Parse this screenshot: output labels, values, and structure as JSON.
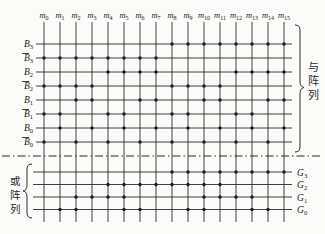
{
  "diagram": {
    "kind": "pla-binary-to-gray-converter",
    "background": "#fbfbf9",
    "line_color": "#2b2b2b",
    "dot_color": "#1a1a1a",
    "minterms": {
      "base": "m",
      "subscripts": [
        "0",
        "1",
        "2",
        "3",
        "4",
        "5",
        "6",
        "7",
        "8",
        "9",
        "10",
        "11",
        "12",
        "13",
        "14",
        "15"
      ]
    },
    "and_array": {
      "brace_label": "与阵列",
      "rows": [
        {
          "base": "B",
          "sub": "3",
          "bar": false,
          "dots": [
            8,
            9,
            10,
            11,
            12,
            13,
            14,
            15
          ]
        },
        {
          "base": "B",
          "sub": "3",
          "bar": true,
          "dots": [
            0,
            1,
            2,
            3,
            4,
            5,
            6,
            7
          ]
        },
        {
          "base": "B",
          "sub": "2",
          "bar": false,
          "dots": [
            4,
            5,
            6,
            7,
            12,
            13,
            14,
            15
          ]
        },
        {
          "base": "B",
          "sub": "2",
          "bar": true,
          "dots": [
            0,
            1,
            2,
            3,
            8,
            9,
            10,
            11
          ]
        },
        {
          "base": "B",
          "sub": "1",
          "bar": false,
          "dots": [
            2,
            3,
            6,
            7,
            10,
            11,
            14,
            15
          ]
        },
        {
          "base": "B",
          "sub": "1",
          "bar": true,
          "dots": [
            0,
            1,
            4,
            5,
            8,
            9,
            12,
            13
          ]
        },
        {
          "base": "B",
          "sub": "0",
          "bar": false,
          "dots": [
            1,
            3,
            5,
            7,
            9,
            11,
            13,
            15
          ]
        },
        {
          "base": "B",
          "sub": "0",
          "bar": true,
          "dots": [
            0,
            2,
            4,
            6,
            8,
            10,
            12,
            14
          ]
        }
      ]
    },
    "or_array": {
      "brace_label": "或阵列",
      "rows": [
        {
          "base": "G",
          "sub": "3",
          "dots": [
            8,
            9,
            10,
            11,
            12,
            13,
            14,
            15
          ]
        },
        {
          "base": "G",
          "sub": "2",
          "dots": [
            4,
            5,
            6,
            7,
            8,
            9,
            10,
            11
          ]
        },
        {
          "base": "G",
          "sub": "1",
          "dots": [
            2,
            3,
            4,
            5,
            10,
            11,
            12,
            13
          ]
        },
        {
          "base": "G",
          "sub": "0",
          "dots": [
            1,
            2,
            5,
            6,
            9,
            10,
            13,
            14
          ]
        }
      ]
    }
  }
}
